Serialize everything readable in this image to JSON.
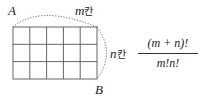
{
  "diagram": {
    "grid": {
      "columns": 5,
      "rows": 3,
      "left": 13,
      "top": 27,
      "cell_w": 16.8,
      "cell_h": 17.3
    },
    "points": {
      "start": "A",
      "end": "B"
    },
    "top_label": {
      "var": "m",
      "unit": "칸"
    },
    "right_label": {
      "var": "n",
      "unit": "칸"
    },
    "formula": {
      "numerator": "(m + n)!",
      "denominator": "m!n!"
    },
    "colors": {
      "line": "#555555",
      "text": "#222222"
    }
  }
}
